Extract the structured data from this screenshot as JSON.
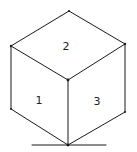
{
  "diagram": {
    "type": "isometric-cube",
    "faces": [
      {
        "id": "left",
        "label": "1"
      },
      {
        "id": "top",
        "label": "2"
      },
      {
        "id": "right",
        "label": "3"
      }
    ],
    "stroke_color": "#1a1a1a",
    "background": "#ffffff"
  }
}
